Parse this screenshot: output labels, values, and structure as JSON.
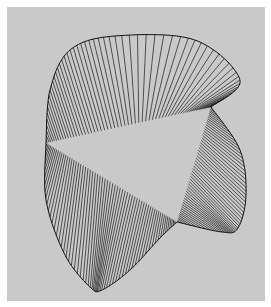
{
  "figure": {
    "title": "",
    "background": "#c9c9c9",
    "line_color": "#1a1a1a",
    "vertices": {
      "top_right": [
        211,
        107
      ],
      "left": [
        46,
        143
      ],
      "cusp": [
        177,
        222
      ]
    },
    "patches": [
      {
        "name": "upper-patch",
        "line_count": 60,
        "edge_a": [
          [
            211,
            107
          ],
          [
            240,
            80
          ],
          [
            195,
            40
          ],
          [
            115,
            36
          ],
          [
            70,
            50
          ],
          [
            50,
            90
          ],
          [
            46,
            143
          ]
        ],
        "edge_b": [
          [
            211,
            107
          ],
          [
            46,
            143
          ]
        ],
        "mode": "ruled"
      },
      {
        "name": "right-patch",
        "line_count": 55,
        "edge_a": [
          [
            211,
            107
          ],
          [
            240,
            150
          ],
          [
            246,
            195
          ],
          [
            238,
            228
          ],
          [
            222,
            232
          ],
          [
            177,
            222
          ]
        ],
        "edge_b": [
          [
            211,
            107
          ],
          [
            177,
            222
          ]
        ],
        "mode": "ruled"
      },
      {
        "name": "lower-left-patch",
        "line_count": 65,
        "edge_a": [
          [
            46,
            143
          ],
          [
            46,
            200
          ],
          [
            65,
            255
          ],
          [
            90,
            287
          ],
          [
            102,
            290
          ],
          [
            130,
            270
          ],
          [
            160,
            238
          ],
          [
            177,
            222
          ]
        ],
        "edge_b": [
          [
            46,
            143
          ],
          [
            177,
            222
          ]
        ],
        "mode": "ruled"
      }
    ]
  }
}
